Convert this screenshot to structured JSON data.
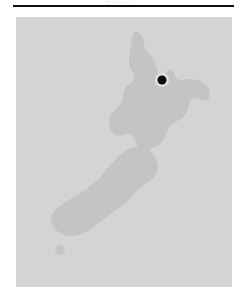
{
  "document": {
    "clipped_caption": "Figure",
    "rule": {
      "color": "#111111"
    }
  },
  "figure": {
    "name": "map-of-new-zealand",
    "sea_color": "#d4d4d4",
    "land_color": "#c4c4c4",
    "marker_color": "#0b0b0b",
    "marker": {
      "label": "location-marker",
      "x": 146,
      "y": 63,
      "radius": 4.5
    },
    "landmasses": [
      {
        "name": "north-island",
        "path": "M 120 14 L 124 17 L 127 22 L 128 28 L 130 33 L 133 37 L 136 40 L 138 44 L 140 48 L 141 52 L 142 56 L 144 59 L 147 60 L 149 57 L 151 54 L 153 52 L 156 53 L 158 57 L 160 61 L 163 63 L 167 63 L 171 62 L 176 62 L 181 63 L 186 65 L 190 68 L 193 72 L 194 77 L 193 81 L 190 83 L 186 83 L 182 82 L 178 81 L 175 82 L 173 86 L 172 91 L 170 96 L 167 100 L 163 103 L 159 105 L 155 108 L 152 112 L 150 117 L 148 122 L 145 126 L 141 129 L 137 131 L 133 133 L 129 134 L 125 133 L 122 130 L 120 126 L 118 121 L 115 118 L 111 117 L 107 118 L 103 119 L 99 118 L 96 115 L 94 111 L 93 106 L 93 101 L 95 97 L 98 94 L 101 91 L 104 88 L 106 84 L 107 79 L 108 74 L 110 70 L 113 67 L 116 65 L 118 62 L 118 58 L 116 54 L 114 50 L 113 45 L 113 40 L 114 34 L 115 28 L 116 22 L 117 17 Z"
      },
      {
        "name": "south-island",
        "path": "M 128 130 L 132 133 L 136 136 L 139 140 L 141 145 L 142 150 L 141 155 L 139 159 L 136 162 L 132 165 L 128 168 L 124 171 L 120 175 L 116 179 L 112 183 L 108 187 L 104 190 L 100 193 L 96 196 L 92 199 L 88 202 L 84 205 L 80 208 L 76 211 L 72 214 L 68 216 L 63 218 L 58 219 L 53 219 L 48 218 L 44 216 L 40 213 L 37 209 L 35 205 L 35 200 L 37 196 L 40 192 L 44 189 L 48 186 L 53 183 L 58 180 L 63 177 L 68 174 L 73 170 L 78 166 L 83 162 L 87 157 L 91 152 L 95 147 L 99 143 L 103 139 L 107 136 L 111 133 L 115 131 L 119 130 L 123 129 Z"
      },
      {
        "name": "stewart-island",
        "path": "M 43 228 L 47 229 L 49 232 L 48 236 L 45 238 L 41 237 L 39 234 L 40 230 Z"
      }
    ]
  }
}
